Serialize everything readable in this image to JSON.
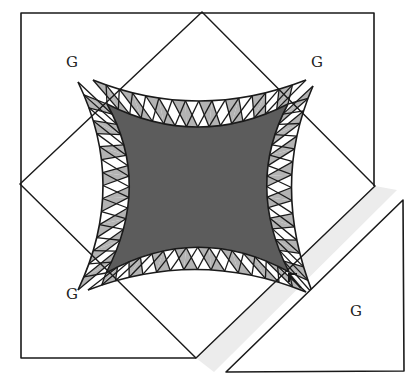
{
  "diagram": {
    "type": "quilt-block-assembly",
    "colors": {
      "line": "#1a1a1a",
      "center_fill": "#5c5c5c",
      "wedge_shaded": "#b3b3b3",
      "wedge_light": "#ffffff",
      "seam_shadow": "#ececec",
      "background": "#ffffff"
    },
    "outer_square": {
      "left": 21,
      "top": 13,
      "right": 374,
      "bottom": 358
    },
    "diamond": {
      "top": [
        202,
        12
      ],
      "right": [
        375,
        186
      ],
      "bottom": [
        196,
        358
      ],
      "left": [
        20,
        184
      ]
    },
    "separated_triangle": {
      "top": [
        403,
        200
      ],
      "bottom_left": [
        226,
        372
      ],
      "bottom_right": [
        404,
        371
      ]
    },
    "corner_labels": [
      {
        "id": "top-left",
        "text": "G",
        "x": 72,
        "y": 62
      },
      {
        "id": "top-right",
        "text": "G",
        "x": 317,
        "y": 62
      },
      {
        "id": "bottom-left",
        "text": "G",
        "x": 72,
        "y": 294
      },
      {
        "id": "bottom-right",
        "text": "G",
        "x": 356,
        "y": 311
      }
    ],
    "arrow": {
      "icon": "arrow-up-left-icon",
      "tip": [
        289,
        274
      ],
      "tail": [
        301,
        288
      ]
    },
    "arcs": [
      {
        "id": "top-arc",
        "wedge_count": 16
      },
      {
        "id": "right-arc",
        "wedge_count": 16
      },
      {
        "id": "bottom-arc",
        "wedge_count": 16
      },
      {
        "id": "left-arc",
        "wedge_count": 16
      }
    ]
  }
}
